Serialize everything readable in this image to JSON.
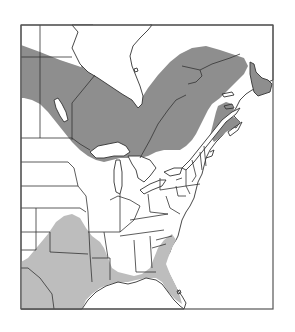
{
  "map": {
    "title": "",
    "region": "Eastern North America",
    "legend": [],
    "colors": {
      "background": "#ffffff",
      "frame": "#555555",
      "outline": "#333333",
      "range_north": "#8e8e8e",
      "range_south": "#bdbdbd"
    },
    "shaded_regions": [
      {
        "name": "northern-boreal-range",
        "tone": "dark"
      },
      {
        "name": "southern-range",
        "tone": "light"
      }
    ]
  }
}
